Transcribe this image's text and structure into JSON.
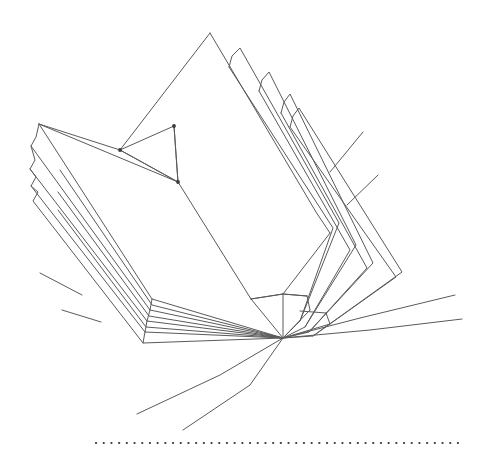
{
  "figure": {
    "style": "line-art",
    "background_color": "#ffffff",
    "line_color": "#5a5a5a",
    "line_color_dark": "#444444",
    "dot_color": "#3a3a3a",
    "canvas": {
      "width": 482,
      "height": 461
    }
  },
  "geometry": {
    "spine_point": {
      "x": 283,
      "y": 338
    },
    "left_cover_top_corner": {
      "x": 39,
      "y": 124
    },
    "main_peak": {
      "x": 210,
      "y": 33
    },
    "inner_fold_vertex": {
      "x": 120,
      "y": 150
    },
    "inner_fold_base": {
      "x": 178,
      "y": 182
    },
    "right_peak_tips": [
      {
        "x": 239,
        "y": 48
      },
      {
        "x": 268,
        "y": 72
      },
      {
        "x": 289,
        "y": 94
      }
    ],
    "left_step_corners": [
      {
        "x": 39,
        "y": 124
      },
      {
        "x": 31,
        "y": 146
      },
      {
        "x": 30,
        "y": 169
      },
      {
        "x": 31,
        "y": 186
      }
    ]
  },
  "elements": {
    "left_page_stack": {
      "name": "Left page stack",
      "page_count": 4,
      "description": "Stepped stacked page edges fanning up-left from the spine"
    },
    "right_page_stack": {
      "name": "Right page stack",
      "page_count": 4,
      "description": "Stepped stacked page edges fanning up-right and folding down to the right"
    },
    "center_peak": {
      "name": "Center standing page",
      "description": "Tall triangular page rising to the apex"
    },
    "spine": {
      "name": "Spine convergence",
      "description": "All page edge lines converge at a single binding point"
    },
    "left_tick_marks": {
      "name": "Left edge tick marks",
      "count": 2
    },
    "right_tick_marks": {
      "name": "Right edge tick marks",
      "count": 2
    },
    "sweeping_curves": {
      "name": "Sweeping page curves",
      "count": 4,
      "description": "Long curved lines sweeping out from the spine to the lower-left and the right"
    },
    "baseline": {
      "name": "Dotted baseline",
      "y": 443,
      "x_start": 96,
      "x_end": 462,
      "dot_spacing": 7.6,
      "dot_count": 49
    }
  },
  "chart_data": {
    "type": "line",
    "xlabel": "",
    "ylabel": "",
    "xlim": [
      0,
      482
    ],
    "ylim": [
      0,
      461
    ],
    "grid": false,
    "legend": "none",
    "series": [
      {
        "name": "left-cover-outer",
        "points": [
          [
            283,
            338
          ],
          [
            152,
            299
          ],
          [
            39,
            124
          ],
          [
            178,
            182
          ]
        ]
      },
      {
        "name": "left-cover-inner-edge",
        "points": [
          [
            39,
            124
          ],
          [
            120,
            150
          ],
          [
            178,
            182
          ]
        ]
      },
      {
        "name": "left-page-1",
        "points": [
          [
            283,
            338
          ],
          [
            148,
            310
          ],
          [
            31,
            146
          ],
          [
            36,
            137
          ],
          [
            39,
            124
          ]
        ]
      },
      {
        "name": "left-page-2",
        "points": [
          [
            283,
            338
          ],
          [
            146,
            320
          ],
          [
            30,
            169
          ],
          [
            34,
            160
          ],
          [
            31,
            146
          ]
        ]
      },
      {
        "name": "left-page-3",
        "points": [
          [
            283,
            338
          ],
          [
            144,
            330
          ],
          [
            31,
            186
          ],
          [
            35,
            177
          ],
          [
            30,
            169
          ]
        ]
      },
      {
        "name": "left-page-4",
        "points": [
          [
            283,
            338
          ],
          [
            142,
            340
          ],
          [
            33,
            200
          ],
          [
            37,
            192
          ],
          [
            31,
            186
          ]
        ]
      },
      {
        "name": "center-peak-left",
        "points": [
          [
            283,
            338
          ],
          [
            250,
            300
          ],
          [
            210,
            33
          ]
        ]
      },
      {
        "name": "center-peak-right",
        "points": [
          [
            210,
            33
          ],
          [
            316,
            212
          ],
          [
            330,
            232
          ]
        ]
      },
      {
        "name": "inner-fold-v",
        "points": [
          [
            120,
            150
          ],
          [
            178,
            182
          ],
          [
            174,
            126
          ],
          [
            178,
            182
          ]
        ]
      },
      {
        "name": "right-page-1",
        "points": [
          [
            283,
            338
          ],
          [
            300,
            320
          ],
          [
            339,
            222
          ],
          [
            239,
            48
          ],
          [
            231,
            56
          ],
          [
            229,
            66
          ]
        ]
      },
      {
        "name": "right-page-2",
        "points": [
          [
            283,
            338
          ],
          [
            304,
            325
          ],
          [
            355,
            244
          ],
          [
            268,
            72
          ],
          [
            261,
            80
          ],
          [
            259,
            90
          ]
        ]
      },
      {
        "name": "right-page-3",
        "points": [
          [
            283,
            338
          ],
          [
            308,
            330
          ],
          [
            372,
            262
          ],
          [
            289,
            94
          ],
          [
            283,
            102
          ],
          [
            281,
            112
          ]
        ]
      },
      {
        "name": "right-page-4",
        "points": [
          [
            283,
            338
          ],
          [
            312,
            335
          ],
          [
            400,
            272
          ],
          [
            298,
            108
          ],
          [
            292,
            116
          ],
          [
            290,
            126
          ]
        ]
      },
      {
        "name": "spine-flap",
        "points": [
          [
            251,
            299
          ],
          [
            283,
            338
          ],
          [
            307,
            315
          ],
          [
            283,
            294
          ],
          [
            251,
            299
          ]
        ]
      },
      {
        "name": "tick-left-1",
        "points": [
          [
            40,
            273
          ],
          [
            82,
            295
          ]
        ]
      },
      {
        "name": "tick-left-2",
        "points": [
          [
            62,
            310
          ],
          [
            101,
            322
          ]
        ]
      },
      {
        "name": "tick-right-1",
        "points": [
          [
            330,
            172
          ],
          [
            363,
            132
          ]
        ]
      },
      {
        "name": "tick-right-2",
        "points": [
          [
            347,
            205
          ],
          [
            378,
            175
          ]
        ]
      },
      {
        "name": "sweep-curve-left-1",
        "points": [
          [
            283,
            338
          ],
          [
            220,
            375
          ],
          [
            137,
            414
          ]
        ]
      },
      {
        "name": "sweep-curve-left-2",
        "points": [
          [
            283,
            338
          ],
          [
            250,
            385
          ],
          [
            183,
            430
          ]
        ]
      },
      {
        "name": "sweep-curve-right-1",
        "points": [
          [
            283,
            338
          ],
          [
            360,
            318
          ],
          [
            455,
            295
          ]
        ]
      },
      {
        "name": "sweep-curve-right-2",
        "points": [
          [
            283,
            338
          ],
          [
            370,
            330
          ],
          [
            462,
            319
          ]
        ]
      }
    ]
  }
}
